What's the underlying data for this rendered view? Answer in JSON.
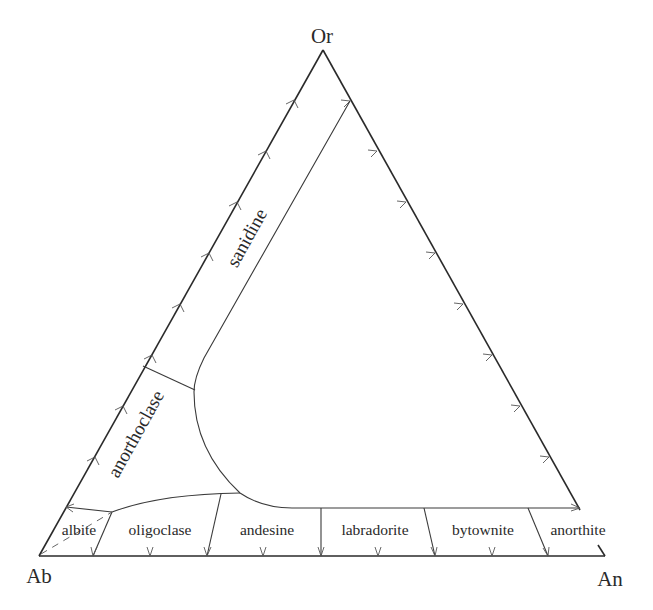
{
  "diagram": {
    "type": "ternary",
    "title": "",
    "vertices": {
      "top": "Or",
      "bottom_left": "Ab",
      "bottom_right": "An"
    },
    "fields": {
      "alkali_feldspars": [
        "sanidine",
        "anorthoclase"
      ],
      "plagioclase": [
        "albite",
        "oligoclase",
        "andesine",
        "labradorite",
        "bytownite",
        "anorthite"
      ]
    },
    "colors": {
      "line": "#2a2a2a",
      "background": "#ffffff"
    },
    "tick_interval_percent": 10
  }
}
